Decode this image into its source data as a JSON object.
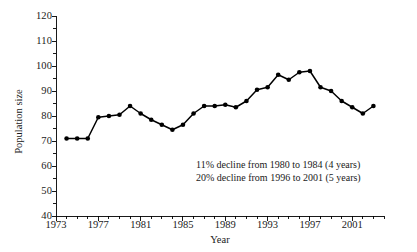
{
  "chart_data": {
    "type": "line",
    "title": "",
    "xlabel": "Year",
    "ylabel": "Population size",
    "xlim": [
      1973,
      2004
    ],
    "ylim": [
      40,
      120
    ],
    "ytick_step": 10,
    "yminor_step": 5,
    "xtick_step": 4,
    "xminor_step": 1,
    "grid": false,
    "legend": null,
    "marker": "filled-circle",
    "line_color": "#000000",
    "marker_color": "#000000",
    "ytick_labels": [
      40,
      50,
      60,
      70,
      80,
      90,
      100,
      110,
      120
    ],
    "xtick_labels": [
      1973,
      1977,
      1981,
      1985,
      1989,
      1993,
      1997,
      2001
    ],
    "x": [
      1974,
      1975,
      1976,
      1977,
      1978,
      1979,
      1980,
      1981,
      1982,
      1983,
      1984,
      1985,
      1986,
      1987,
      1988,
      1989,
      1990,
      1991,
      1992,
      1993,
      1994,
      1995,
      1996,
      1997,
      1998,
      1999,
      2000,
      2001,
      2002,
      2003
    ],
    "values": [
      71,
      71,
      71,
      79.5,
      80,
      80.5,
      84,
      81,
      78.5,
      76.5,
      74.5,
      76.5,
      81,
      84,
      84,
      84.5,
      83.5,
      86,
      90.5,
      91.5,
      96.5,
      94.5,
      97.5,
      98,
      91.5,
      90,
      86,
      83.5,
      81,
      84
    ],
    "annotations": [
      "11% decline from 1980 to 1984 (4 years)",
      "20% decline from 1996 to 2001 (5 years)"
    ]
  }
}
